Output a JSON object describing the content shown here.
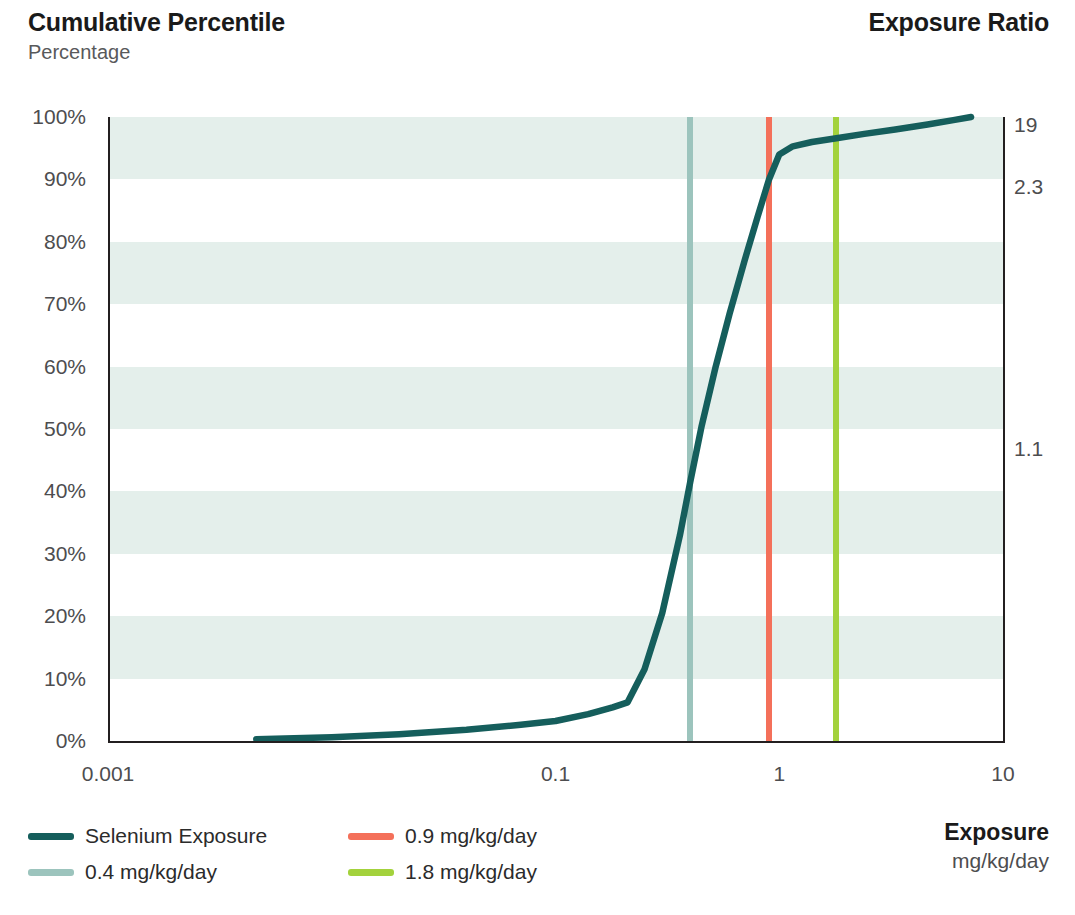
{
  "header": {
    "title": "Cumulative Percentile",
    "subtitle": "Percentage",
    "right_title": "Exposure Ratio"
  },
  "axis_titles": {
    "x_title": "Exposure",
    "x_units": "mg/kg/day"
  },
  "legend": {
    "items": [
      {
        "label": "Selenium Exposure",
        "color": "#155e5c"
      },
      {
        "label": "0.9 mg/kg/day",
        "color": "#f4705a"
      },
      {
        "label": "0.4 mg/kg/day",
        "color": "#9cc4bd"
      },
      {
        "label": "1.8 mg/kg/day",
        "color": "#a3d23c"
      }
    ]
  },
  "chart_data": {
    "type": "line",
    "title": "Cumulative Percentile",
    "subtitle": "Percentage",
    "xlabel": "Exposure",
    "xunits": "mg/kg/day",
    "ylabel": "Percentage",
    "y2label": "Exposure Ratio",
    "xscale": "log",
    "xlim": [
      0.001,
      10
    ],
    "ylim": [
      0,
      100
    ],
    "grid": "horizontal-bands",
    "legend_position": "bottom-left",
    "xticks": [
      "0.001",
      "0.1",
      "1",
      "10"
    ],
    "xtick_values": [
      0.001,
      0.1,
      1,
      10
    ],
    "yticks": [
      "0%",
      "10%",
      "20%",
      "30%",
      "40%",
      "50%",
      "60%",
      "70%",
      "80%",
      "90%",
      "100%"
    ],
    "ytick_values": [
      0,
      10,
      20,
      30,
      40,
      50,
      60,
      70,
      80,
      90,
      100
    ],
    "y2ticks": [
      {
        "label": "19",
        "at_percent": 100
      },
      {
        "label": "2.3",
        "at_percent": 90
      },
      {
        "label": "1.1",
        "at_percent": 48
      }
    ],
    "series": [
      {
        "name": "Selenium Exposure",
        "color": "#155e5c",
        "x": [
          0.0046,
          0.01,
          0.02,
          0.04,
          0.07,
          0.1,
          0.14,
          0.18,
          0.21,
          0.25,
          0.3,
          0.36,
          0.4,
          0.45,
          0.52,
          0.6,
          0.7,
          0.8,
          0.9,
          1.0,
          1.15,
          1.4,
          1.8,
          2.4,
          3.3,
          4.6,
          6.0,
          7.2
        ],
        "y": [
          0.3,
          0.6,
          1.1,
          1.8,
          2.6,
          3.2,
          4.3,
          5.4,
          6.2,
          11.5,
          20.5,
          33.0,
          41.5,
          50.5,
          60.0,
          68.5,
          77.0,
          84.0,
          90.0,
          94.0,
          95.3,
          96.0,
          96.6,
          97.3,
          98.0,
          98.8,
          99.5,
          100.0
        ]
      }
    ],
    "reference_lines": [
      {
        "label": "0.4 mg/kg/day",
        "value": 0.4,
        "color": "#9cc4bd"
      },
      {
        "label": "0.9 mg/kg/day",
        "value": 0.9,
        "color": "#f4705a"
      },
      {
        "label": "1.8 mg/kg/day",
        "value": 1.8,
        "color": "#a3d23c"
      }
    ],
    "annotations": []
  }
}
